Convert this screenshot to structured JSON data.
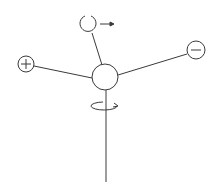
{
  "diagram": {
    "type": "molecular-orientation-schematic",
    "stroke_color": "#3a3a3a",
    "background": "#ffffff",
    "nodes": [
      {
        "id": "center",
        "label": "",
        "shape": "circle"
      },
      {
        "id": "positive",
        "label": "+",
        "shape": "circle"
      },
      {
        "id": "negative",
        "label": "−",
        "shape": "circle"
      },
      {
        "id": "top",
        "label": "",
        "shape": "open-circle"
      }
    ],
    "edges": [
      {
        "from": "center",
        "to": "positive"
      },
      {
        "from": "center",
        "to": "negative"
      },
      {
        "from": "center",
        "to": "top"
      },
      {
        "from": "center",
        "to": "stem-end"
      }
    ],
    "annotations": [
      {
        "id": "translation-arrow",
        "description": "right-pointing arrow next to top circle"
      },
      {
        "id": "rotation-arrow",
        "description": "elliptical rotation arrow around vertical stem"
      }
    ]
  }
}
